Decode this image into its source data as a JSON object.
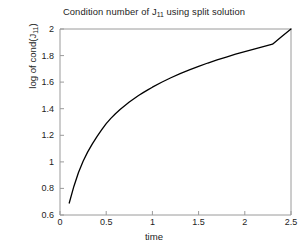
{
  "figure": {
    "background_color": "#ffffff",
    "width": 308,
    "height": 252
  },
  "chart_data": {
    "type": "line",
    "title_plain": "Condition number of J11 using split solution",
    "title_prefix": "Condition number of J",
    "title_subscript": "11",
    "title_suffix": " using split solution",
    "xlabel": "time",
    "ylabel_prefix": "log of cond(J",
    "ylabel_subscript": "11",
    "ylabel_suffix": ")",
    "ylabel_plain": "log of cond(J11)",
    "xlim": [
      0,
      2.5
    ],
    "ylim": [
      0.6,
      2.0
    ],
    "xticks": [
      0,
      0.5,
      1,
      1.5,
      2,
      2.5
    ],
    "xticklabels": [
      "0",
      "0.5",
      "1",
      "1.5",
      "2",
      "2.5"
    ],
    "yticks": [
      0.6,
      0.8,
      1.0,
      1.2,
      1.4,
      1.6,
      1.8,
      2.0
    ],
    "yticklabels": [
      "0.6",
      "0.8",
      "1",
      "1.2",
      "1.4",
      "1.6",
      "1.8",
      "2"
    ],
    "grid": false,
    "legend": null,
    "line_color": "#000000",
    "line_width": 1.3,
    "axis_color": "#9a9a9a",
    "series": [
      {
        "name": "log of cond(J11)",
        "x": [
          0.1,
          0.15,
          0.2,
          0.25,
          0.3,
          0.35,
          0.4,
          0.45,
          0.5,
          0.55,
          0.6,
          0.65,
          0.7,
          0.75,
          0.8,
          0.85,
          0.9,
          0.95,
          1.0,
          1.1,
          1.2,
          1.3,
          1.4,
          1.5,
          1.6,
          1.7,
          1.8,
          1.9,
          2.0,
          2.1,
          2.2,
          2.3,
          2.4,
          2.5
        ],
        "y": [
          0.69,
          0.815,
          0.92,
          1.005,
          1.075,
          1.135,
          1.19,
          1.24,
          1.288,
          1.327,
          1.362,
          1.394,
          1.423,
          1.45,
          1.475,
          1.499,
          1.521,
          1.542,
          1.562,
          1.599,
          1.633,
          1.664,
          1.692,
          1.719,
          1.744,
          1.767,
          1.789,
          1.81,
          1.83,
          1.849,
          1.868,
          1.886,
          1.943,
          2.0
        ]
      }
    ]
  }
}
